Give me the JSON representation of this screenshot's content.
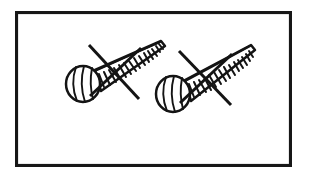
{
  "figure": {
    "title": "Two wood screws crossed out",
    "subject": "screw",
    "count": 2,
    "style": "black-and-white line drawing",
    "prohibition_marker": "X",
    "meaning": "do not use screws",
    "background_color": "#ffffff",
    "ink_color": "#141414",
    "frame_color": "#171717",
    "caption": ""
  },
  "frame": {
    "name": "illustration-border",
    "x": 15,
    "y": 11,
    "width": 277,
    "height": 156,
    "stroke_width": 3.1
  },
  "objects": [
    {
      "id": "screw-left",
      "label": "screw",
      "head": {
        "shape": "round-ball-head",
        "center_x": 83,
        "center_y": 84,
        "radius_x": 17,
        "radius_y": 18,
        "rib_count": 3
      },
      "shaft": {
        "shape": "tapered-threaded-cone",
        "base_x": 98,
        "base_y": 80,
        "tip_x": 163,
        "tip_y": 43,
        "base_half_width": 12,
        "tip_half_width": 3,
        "thread_count": 14,
        "angle_deg": -29
      },
      "strike": {
        "marker": "X",
        "stroke_1": {
          "x1": 89,
          "y1": 45,
          "x2": 139,
          "y2": 99
        },
        "stroke_2": {
          "x1": 90,
          "y1": 96,
          "x2": 141,
          "y2": 48
        }
      }
    },
    {
      "id": "screw-right",
      "label": "screw",
      "head": {
        "shape": "round-ball-head",
        "center_x": 173,
        "center_y": 94,
        "radius_x": 17,
        "radius_y": 18,
        "rib_count": 3
      },
      "shaft": {
        "shape": "tapered-threaded-cone",
        "base_x": 188,
        "base_y": 90,
        "tip_x": 253,
        "tip_y": 47,
        "base_half_width": 12,
        "tip_half_width": 3,
        "thread_count": 14,
        "angle_deg": -29
      },
      "strike": {
        "marker": "X",
        "stroke_1": {
          "x1": 179,
          "y1": 51,
          "x2": 231,
          "y2": 105
        },
        "stroke_2": {
          "x1": 180,
          "y1": 103,
          "x2": 232,
          "y2": 54
        }
      }
    }
  ]
}
